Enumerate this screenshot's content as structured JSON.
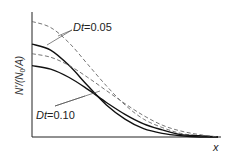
{
  "chart_data": {
    "type": "line",
    "title": "",
    "xlabel": "x",
    "ylabel": "N'/(N0/A)",
    "ylabel_parts": {
      "pre": "N'/(N",
      "sub": "0",
      "post": "/A)"
    },
    "grid": false,
    "legend": "inline annotations with leader lines",
    "annotations": [
      {
        "text_italic": "Dt",
        "text_value": "=0.05",
        "full": "Dt=0.05",
        "points_to": [
          "solid_Dt0.05",
          "dashed_Dt0.05"
        ]
      },
      {
        "text_italic": "Dt",
        "text_value": "=0.10",
        "full": "Dt=0.10",
        "points_to": [
          "solid_Dt0.10",
          "dashed_Dt0.10"
        ]
      }
    ],
    "x": [
      0,
      0.1,
      0.2,
      0.3,
      0.4,
      0.5,
      0.6,
      0.7,
      0.8,
      0.9,
      1.0
    ],
    "series": [
      {
        "name": "solid_Dt0.05",
        "style": "solid",
        "values": [
          0.78,
          0.73,
          0.6,
          0.43,
          0.27,
          0.15,
          0.07,
          0.03,
          0.01,
          0.0,
          0.0
        ]
      },
      {
        "name": "dashed_Dt0.05",
        "style": "dashed",
        "values": [
          0.97,
          0.92,
          0.79,
          0.61,
          0.43,
          0.27,
          0.15,
          0.08,
          0.03,
          0.01,
          0.0
        ]
      },
      {
        "name": "solid_Dt0.10",
        "style": "solid",
        "values": [
          0.6,
          0.57,
          0.5,
          0.4,
          0.29,
          0.19,
          0.11,
          0.06,
          0.02,
          0.01,
          0.0
        ]
      },
      {
        "name": "dashed_Dt0.10",
        "style": "dashed",
        "values": [
          0.7,
          0.67,
          0.6,
          0.5,
          0.39,
          0.28,
          0.18,
          0.1,
          0.05,
          0.02,
          0.0
        ]
      }
    ],
    "ylim": [
      0,
      1.05
    ],
    "xlim": [
      0,
      1.0
    ]
  },
  "labels": {
    "x_axis": "x",
    "y_axis_pre": "N'/(N",
    "y_axis_sub": "0",
    "y_axis_post": "/A)",
    "dt_italic": "Dt",
    "ann1_value": "=0.05",
    "ann2_value": "=0.10"
  }
}
